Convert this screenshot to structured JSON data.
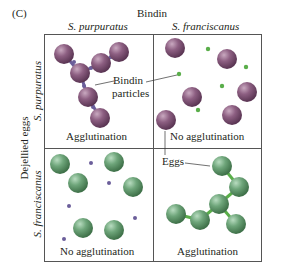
{
  "figure": {
    "panel_label": "(C)",
    "column_header": "Bindin",
    "columns": [
      "S. purpuratus",
      "S. franciscanus"
    ],
    "row_header": "Dejellied eggs",
    "rows": [
      "S. purpuratus",
      "S. franciscanus"
    ],
    "annotations": {
      "bindin_particles_line1": "Bindin",
      "bindin_particles_line2": "particles",
      "eggs": "Eggs"
    },
    "cells": [
      {
        "row": "S. purpuratus",
        "column": "S. purpuratus",
        "result": "Agglutination"
      },
      {
        "row": "S. purpuratus",
        "column": "S. franciscanus",
        "result": "No agglutination"
      },
      {
        "row": "S. franciscanus",
        "column": "S. purpuratus",
        "result": "No agglutination"
      },
      {
        "row": "S. franciscanus",
        "column": "S. franciscanus",
        "result": "Agglutination"
      }
    ],
    "colors": {
      "purple_egg": "#8a5a7e",
      "green_egg": "#6ea57a",
      "purple_particle": "#6b5e9a",
      "green_particle": "#5aae4a",
      "grid": "#555555"
    }
  }
}
